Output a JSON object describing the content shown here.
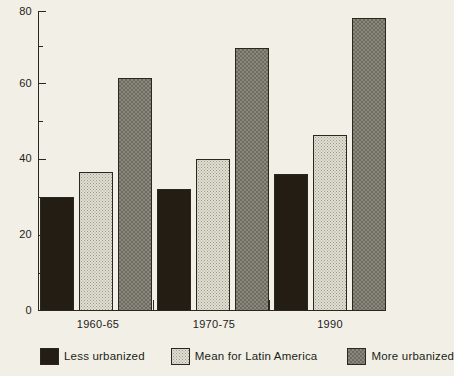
{
  "chart_data": {
    "type": "bar",
    "title": "",
    "subtitle": "",
    "xlabel": "",
    "ylabel": "",
    "ylim": [
      0,
      80
    ],
    "yticks": [
      0,
      20,
      40,
      60,
      80
    ],
    "ytick_labels": [
      "0",
      "20",
      "40",
      "60",
      "80"
    ],
    "minor_yticks": [
      10,
      30,
      50,
      70
    ],
    "grid": false,
    "legend_position": "below-axes",
    "categories": [
      "1960-65",
      "1970-75",
      "1990"
    ],
    "series": [
      {
        "name": "Less urbanized",
        "values": [
          30.5,
          32.5,
          36.5
        ],
        "fill": "solid-dark",
        "color": "#241d14"
      },
      {
        "name": "Mean for Latin America",
        "values": [
          37.0,
          40.5,
          47.0
        ],
        "fill": "light-dotted",
        "color": "#e2e0d2"
      },
      {
        "name": "More urbanized",
        "values": [
          62.0,
          70.0,
          78.0
        ],
        "fill": "gray-checker",
        "color": "#8a887c"
      }
    ]
  },
  "axes": {
    "y_tick_labels": [
      "80",
      "60",
      "40",
      "20",
      "0"
    ],
    "x_tick_labels": [
      "1960-65",
      "1970-75",
      "1990"
    ]
  },
  "legend": {
    "items": [
      {
        "label": "Less urbanized"
      },
      {
        "label": "Mean for Latin America"
      },
      {
        "label": "More urbanized"
      }
    ]
  },
  "colors": {
    "background": "#f2f0e6",
    "axis": "#2a2720",
    "text": "#24211b",
    "series_dark": "#241d14",
    "series_light": "#e2e0d2",
    "series_gray": "#8a887c"
  }
}
